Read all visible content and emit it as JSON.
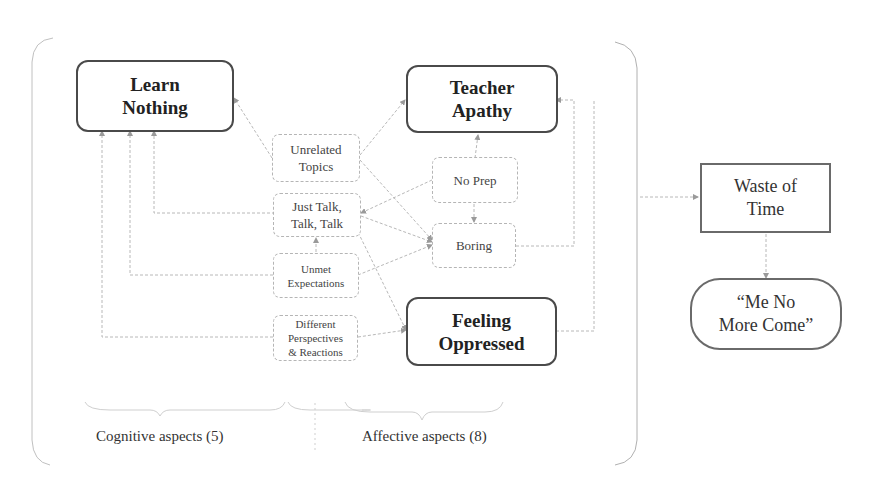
{
  "diagram": {
    "major_nodes": {
      "learn_nothing": "Learn\nNothing",
      "teacher_apathy": "Teacher\nApathy",
      "feeling_oppressed": "Feeling\nOppressed"
    },
    "minor_nodes": {
      "unrelated_topics": "Unrelated\nTopics",
      "just_talk": "Just Talk,\nTalk, Talk",
      "unmet_expectations": "Unmet\nExpectations",
      "different_perspectives": "Different\nPerspectives\n& Reactions",
      "no_prep": "No Prep",
      "boring": "Boring"
    },
    "outcomes": {
      "waste_of_time": "Waste of\nTime",
      "me_no_more_come": "“Me No\nMore Come”"
    },
    "captions": {
      "cognitive": "Cognitive aspects (5)",
      "affective": "Affective aspects (8)"
    },
    "edges": [
      {
        "from": "Unrelated Topics",
        "to": "Learn Nothing"
      },
      {
        "from": "Just Talk, Talk, Talk",
        "to": "Learn Nothing"
      },
      {
        "from": "Unmet Expectations",
        "to": "Learn Nothing"
      },
      {
        "from": "Different Perspectives & Reactions",
        "to": "Learn Nothing"
      },
      {
        "from": "Unrelated Topics",
        "to": "Teacher Apathy"
      },
      {
        "from": "Unrelated Topics",
        "to": "Boring"
      },
      {
        "from": "No Prep",
        "to": "Just Talk, Talk, Talk"
      },
      {
        "from": "Just Talk, Talk, Talk",
        "to": "Boring"
      },
      {
        "from": "Just Talk, Talk, Talk",
        "to": "Feeling Oppressed"
      },
      {
        "from": "Unmet Expectations",
        "to": "Just Talk, Talk, Talk"
      },
      {
        "from": "Unmet Expectations",
        "to": "Boring"
      },
      {
        "from": "Different Perspectives & Reactions",
        "to": "Feeling Oppressed"
      },
      {
        "from": "No Prep",
        "to": "Teacher Apathy"
      },
      {
        "from": "No Prep",
        "to": "Boring"
      },
      {
        "from": "Boring",
        "to": "Teacher Apathy"
      },
      {
        "from": "Feeling Oppressed",
        "to": "Teacher Apathy"
      },
      {
        "from": "Group",
        "to": "Waste of Time"
      },
      {
        "from": "Waste of Time",
        "to": "“Me No More Come”"
      }
    ],
    "colors": {
      "major_border": "#4a4a4a",
      "minor_border": "#b5b5b5",
      "link": "#b0b0b0",
      "text": "#2a2a2a"
    }
  }
}
